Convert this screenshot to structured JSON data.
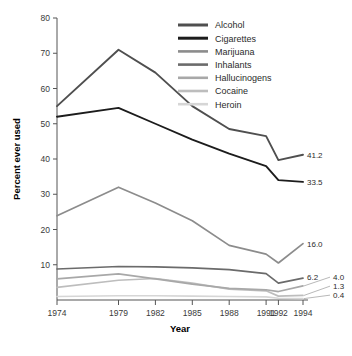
{
  "chart_data": {
    "type": "line",
    "title": "",
    "xlabel": "Year",
    "ylabel": "Percent ever used",
    "xlim": [
      1974,
      1994
    ],
    "ylim": [
      0,
      80
    ],
    "yticks": [
      0,
      10,
      20,
      30,
      40,
      50,
      60,
      70,
      80
    ],
    "ytick_labels": [
      "",
      "10",
      "20",
      "30",
      "40",
      "50",
      "60",
      "70",
      "80"
    ],
    "xticks": [
      1974,
      1979,
      1982,
      1985,
      1988,
      1991,
      1992,
      1994
    ],
    "xtick_labels": [
      "1974",
      "1979",
      "1982",
      "1985",
      "1988",
      "1991",
      "1992",
      "1994"
    ],
    "grid": false,
    "legend_position": "top-right",
    "x": [
      1974,
      1979,
      1982,
      1985,
      1988,
      1991,
      1992,
      1994
    ],
    "series": [
      {
        "name": "Alcohol",
        "color": "#4f4f4f",
        "values": [
          55.0,
          71.0,
          64.5,
          55.0,
          48.5,
          46.5,
          39.7,
          41.2
        ],
        "end_label": "41.2"
      },
      {
        "name": "Cigarettes",
        "color": "#1c1c1c",
        "values": [
          52.0,
          54.5,
          50.0,
          45.5,
          41.5,
          38.0,
          34.0,
          33.5
        ],
        "end_label": "33.5"
      },
      {
        "name": "Marijuana",
        "color": "#8c8c8c",
        "values": [
          23.9,
          32.0,
          27.5,
          22.5,
          15.5,
          13.0,
          10.5,
          16.0
        ],
        "end_label": "16.0"
      },
      {
        "name": "Inhalants",
        "color": "#6b6b6b",
        "values": [
          8.8,
          9.5,
          9.4,
          9.1,
          8.6,
          7.5,
          4.8,
          6.2
        ],
        "end_label": "6.2"
      },
      {
        "name": "Hallucinogens",
        "color": "#a8a8a8",
        "values": [
          6.0,
          7.4,
          6.0,
          4.5,
          3.3,
          2.9,
          2.4,
          4.0
        ],
        "end_label": "4.0"
      },
      {
        "name": "Cocaine",
        "color": "#bdbdbd",
        "values": [
          3.6,
          5.6,
          6.1,
          4.8,
          3.1,
          2.6,
          1.1,
          1.3
        ],
        "end_label": "1.3"
      },
      {
        "name": "Heroin",
        "color": "#d6d6d6",
        "values": [
          1.0,
          1.2,
          1.2,
          1.1,
          1.0,
          0.9,
          0.5,
          0.4
        ],
        "end_label": "0.4"
      }
    ]
  },
  "legend": {
    "entries": [
      {
        "label": "Alcohol"
      },
      {
        "label": "Cigarettes"
      },
      {
        "label": "Marijuana"
      },
      {
        "label": "Inhalants"
      },
      {
        "label": "Hallucinogens"
      },
      {
        "label": "Cocaine"
      },
      {
        "label": "Heroin"
      }
    ]
  },
  "axes": {
    "x_title": "Year",
    "y_title": "Percent ever used"
  }
}
